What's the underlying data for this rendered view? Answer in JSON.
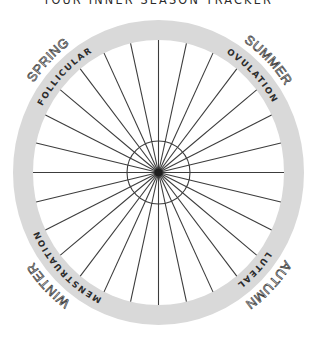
{
  "title": "YOUR INNER SEASON TRACKER",
  "colors": {
    "ring": "#d9d9d9",
    "spoke": "#3c3c3c",
    "text": "#2b2b2b",
    "background": "#ffffff"
  },
  "wheel": {
    "days": 28,
    "center": [
      158.5,
      172.5
    ],
    "outer_radius_x": 145.5,
    "outer_radius_y": 152.5,
    "ring_width": 20,
    "inner_circle_radius": 31.5
  },
  "phases": [
    {
      "label": "FOLLICULAR",
      "angle": -45
    },
    {
      "label": "OVULATION",
      "angle": 45
    },
    {
      "label": "LUTEAL",
      "angle": 135
    },
    {
      "label": "MENSTRUATION",
      "angle": 225
    }
  ],
  "seasons": [
    {
      "label": "SPRING",
      "angle": -45
    },
    {
      "label": "SUMMER",
      "angle": 45
    },
    {
      "label": "AUTUMN",
      "angle": 135
    },
    {
      "label": "WINTER",
      "angle": 225
    }
  ]
}
